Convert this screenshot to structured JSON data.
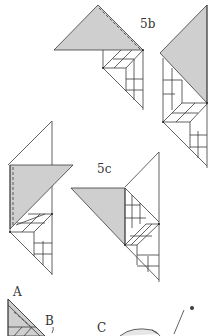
{
  "labels": {
    "fig_5b": "5b",
    "fig_5c": "5c",
    "point_a": "A",
    "point_b": "B",
    "point_c": "C"
  },
  "colors": {
    "shade": "#cfcfcf",
    "line": "#3a3a3a",
    "background": "#ffffff"
  }
}
